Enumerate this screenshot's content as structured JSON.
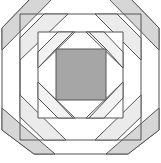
{
  "diagram": {
    "type": "quilt-block",
    "pattern": "pineapple",
    "colors": {
      "background": "#ffffff",
      "outline": "#555555",
      "center": "#a6a6a6",
      "dark_strip": "#d6d6d6",
      "light_strip": "#ebebeb",
      "white": "#ffffff"
    },
    "rings": 3,
    "center_square": {
      "x": 56,
      "y": 49,
      "w": 50,
      "h": 51
    }
  }
}
